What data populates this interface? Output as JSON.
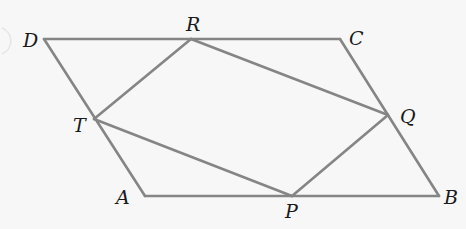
{
  "diagram": {
    "type": "geometry",
    "colors": {
      "background": "#f7f7f7",
      "line": "#858585",
      "label": "#1a1a1a"
    },
    "vertices": {
      "D": {
        "label": "D",
        "x": 44,
        "y": 39
      },
      "R": {
        "label": "R",
        "x": 191,
        "y": 39
      },
      "C": {
        "label": "C",
        "x": 340,
        "y": 39
      },
      "T": {
        "label": "T",
        "x": 94,
        "y": 119
      },
      "Q": {
        "label": "Q",
        "x": 388,
        "y": 115
      },
      "A": {
        "label": "A",
        "x": 145,
        "y": 196
      },
      "P": {
        "label": "P",
        "x": 292,
        "y": 196
      },
      "B": {
        "label": "B",
        "x": 439,
        "y": 196
      }
    },
    "outer_shape": {
      "name": "parallelogram ABCD",
      "edges": [
        [
          "D",
          "C"
        ],
        [
          "C",
          "B"
        ],
        [
          "B",
          "A"
        ],
        [
          "A",
          "D"
        ]
      ]
    },
    "inner_shape": {
      "name": "quadrilateral PQRT",
      "edges": [
        [
          "R",
          "Q"
        ],
        [
          "Q",
          "P"
        ],
        [
          "P",
          "T"
        ],
        [
          "T",
          "R"
        ]
      ]
    }
  }
}
